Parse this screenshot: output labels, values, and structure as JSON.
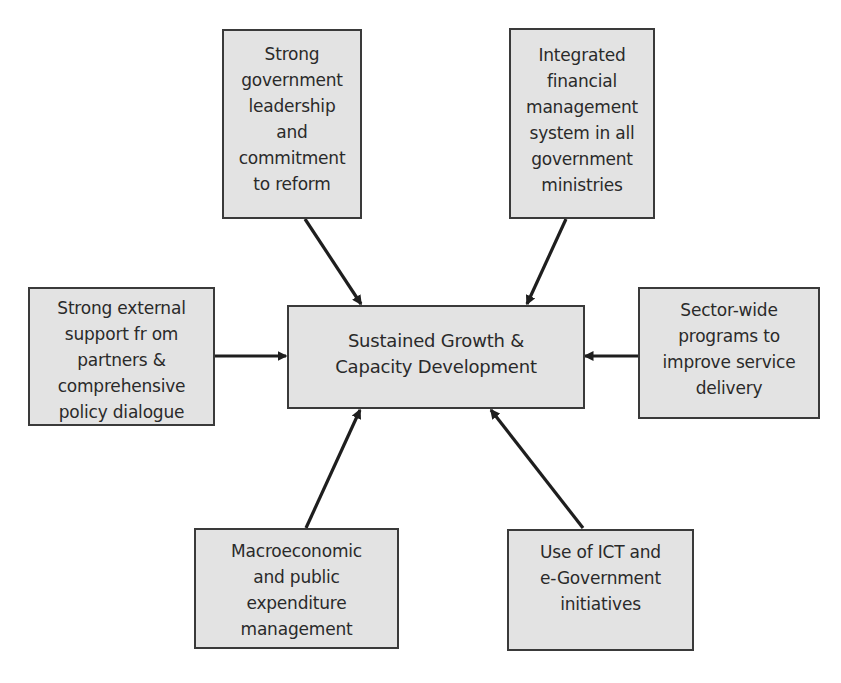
{
  "diagram": {
    "center": {
      "label": "Sustained Growth &\nCapacity Development"
    },
    "nodes": [
      {
        "id": "top-left",
        "label": "Strong\ngovernment\nleadership\nand\ncommitment\nto reform"
      },
      {
        "id": "top-right",
        "label": "Integrated\nfinancial\nmanagement\nsystem in all\ngovernment\nministries"
      },
      {
        "id": "left",
        "label": "Strong external\nsupport fr om\npartners &\ncomprehensive\npolicy dialogue"
      },
      {
        "id": "right",
        "label": "Sector-wide\nprograms to\nimprove service\ndelivery"
      },
      {
        "id": "bottom-left",
        "label": "Macroeconomic\nand public\nexpenditure\nmanagement"
      },
      {
        "id": "bottom-right",
        "label": "Use of ICT and\ne-Government\ninitiatives"
      }
    ],
    "edges": [
      {
        "from": "top-left",
        "to": "center"
      },
      {
        "from": "top-right",
        "to": "center"
      },
      {
        "from": "left",
        "to": "center"
      },
      {
        "from": "right",
        "to": "center"
      },
      {
        "from": "bottom-left",
        "to": "center"
      },
      {
        "from": "bottom-right",
        "to": "center"
      }
    ],
    "colors": {
      "box_fill": "#e3e3e3",
      "box_border": "#3a3a3a",
      "arrow": "#1e1e1e",
      "text": "#2a2a2a"
    }
  }
}
